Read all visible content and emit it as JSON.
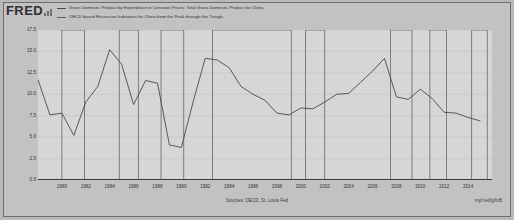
{
  "brand": {
    "logo_text": "FRED",
    "logo_mark": "bar-chart-icon"
  },
  "legend": [
    {
      "label": "Gross Domestic Product by Expenditure in Constant Prices: Total Gross Domestic Product for China",
      "color": "#4a4a4a",
      "style": "line"
    },
    {
      "label": "OECD based Recession Indicators for China from the Peak through the Trough",
      "color": "#5a5a5a",
      "style": "line"
    }
  ],
  "footer": {
    "source": "Sources: OECD, St. Louis Fed",
    "permalink": "myf.red/g/fnB"
  },
  "chart_data": {
    "type": "line",
    "title": "",
    "subtitle": "",
    "xlabel": "",
    "ylabel": "Growth Rate Previous Period, +1 or -1 = 1%",
    "ylim": [
      0.0,
      17.5
    ],
    "xlim": [
      1978,
      2016
    ],
    "grid": true,
    "legend_position": "top",
    "ytick_labels": [
      "17.5",
      "15.0",
      "12.5",
      "10.0",
      "7.5",
      "5.0",
      "2.5",
      "0.0"
    ],
    "ytick_values": [
      17.5,
      15.0,
      12.5,
      10.0,
      7.5,
      5.0,
      2.5,
      0.0
    ],
    "xtick_labels": [
      "1980",
      "1982",
      "1984",
      "1986",
      "1988",
      "1990",
      "1992",
      "1994",
      "1996",
      "1998",
      "2000",
      "2002",
      "2004",
      "2006",
      "2008",
      "2010",
      "2012",
      "2014"
    ],
    "xtick_values": [
      1980,
      1982,
      1984,
      1986,
      1988,
      1990,
      1992,
      1994,
      1996,
      1998,
      2000,
      2002,
      2004,
      2006,
      2008,
      2010,
      2012,
      2014
    ],
    "series": [
      {
        "name": "Gross Domestic Product by Expenditure in Constant Prices: Total Gross Domestic Product for China",
        "color": "#4a4a4a",
        "x": [
          1978,
          1979,
          1980,
          1981,
          1982,
          1983,
          1984,
          1985,
          1986,
          1987,
          1988,
          1989,
          1990,
          1991,
          1992,
          1993,
          1994,
          1995,
          1996,
          1997,
          1998,
          1999,
          2000,
          2001,
          2002,
          2003,
          2004,
          2005,
          2006,
          2007,
          2008,
          2009,
          2010,
          2011,
          2012,
          2013,
          2014,
          2015
        ],
        "y": [
          11.7,
          7.6,
          7.8,
          5.2,
          9.1,
          10.9,
          15.2,
          13.5,
          8.8,
          11.6,
          11.3,
          4.1,
          3.8,
          9.2,
          14.2,
          14.0,
          13.1,
          10.9,
          10.0,
          9.3,
          7.8,
          7.6,
          8.4,
          8.3,
          9.1,
          10.0,
          10.1,
          11.4,
          12.7,
          14.2,
          9.7,
          9.4,
          10.6,
          9.5,
          7.9,
          7.8,
          7.3,
          6.9
        ]
      }
    ],
    "recession_bands": [
      {
        "start": 1980.0,
        "end": 1981.9
      },
      {
        "start": 1984.8,
        "end": 1986.4
      },
      {
        "start": 1988.3,
        "end": 1990.2
      },
      {
        "start": 1992.6,
        "end": 1999.2
      },
      {
        "start": 2000.4,
        "end": 2002.0
      },
      {
        "start": 2007.5,
        "end": 2009.3
      },
      {
        "start": 2010.8,
        "end": 2012.2
      },
      {
        "start": 2014.3,
        "end": 2015.6
      }
    ]
  }
}
